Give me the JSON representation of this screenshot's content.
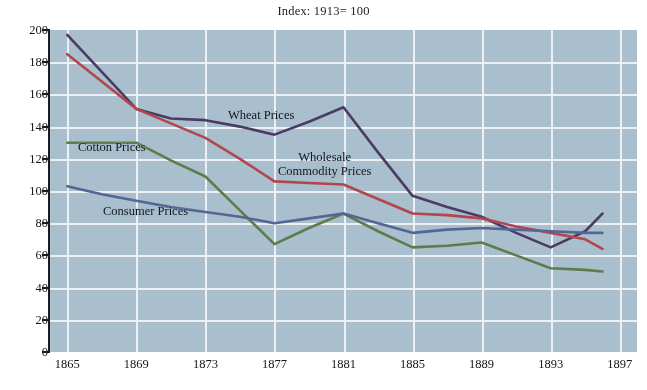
{
  "chart_data": {
    "type": "line",
    "title": "Index: 1913= 100",
    "xlabel": "",
    "ylabel": "",
    "xlim": [
      1864,
      1898
    ],
    "ylim": [
      0,
      200
    ],
    "ytick_step": 20,
    "grid": true,
    "legend_position": "inline-annotations",
    "background_color": "#a8bfcd",
    "gridline_color": "#edf2f6",
    "axis_color": "#1b1b24",
    "x_ticks": [
      "1865",
      "1869",
      "1873",
      "1877",
      "1881",
      "1885",
      "1889",
      "1893",
      "1897"
    ],
    "y_ticks": [
      "0",
      "20",
      "40",
      "60",
      "80",
      "100",
      "120",
      "140",
      "160",
      "180",
      "200"
    ],
    "x": [
      1865,
      1867,
      1869,
      1871,
      1873,
      1875,
      1877,
      1879,
      1881,
      1883,
      1885,
      1887,
      1889,
      1891,
      1893,
      1895,
      1896
    ],
    "series": [
      {
        "name": "Wheat Prices",
        "color": "#4a3a63",
        "values": [
          197,
          174,
          151,
          145,
          144,
          140,
          135,
          143,
          152,
          124,
          97,
          90,
          84,
          74,
          65,
          75,
          86
        ]
      },
      {
        "name": "Wholesale Commodity Prices",
        "color": "#b3444b",
        "values": [
          185,
          168,
          151,
          142,
          133,
          120,
          106,
          105,
          104,
          95,
          86,
          85,
          83,
          78,
          74,
          70,
          64
        ]
      },
      {
        "name": "Cotton Prices",
        "color": "#5c7a4a",
        "values": [
          130,
          130,
          130,
          119,
          109,
          88,
          67,
          77,
          86,
          75,
          65,
          66,
          68,
          60,
          52,
          51,
          50
        ]
      },
      {
        "name": "Consumer Prices",
        "color": "#546493",
        "values": [
          103,
          98,
          94,
          90,
          87,
          84,
          80,
          83,
          86,
          80,
          74,
          76,
          77,
          76,
          75,
          74,
          74
        ]
      }
    ],
    "annotations": [
      {
        "text": "Wheat Prices",
        "x_px": 228,
        "y_px": 108
      },
      {
        "text_line1": "Wholesale",
        "text_line2": "Commodity Prices",
        "x_px": 278,
        "y_px": 150
      },
      {
        "text": "Cotton Prices",
        "x_px": 78,
        "y_px": 140
      },
      {
        "text": "Consumer Prices",
        "x_px": 103,
        "y_px": 204
      }
    ]
  },
  "labels": {
    "title": "Index: 1913= 100",
    "wheat": "Wheat Prices",
    "cotton": "Cotton Prices",
    "consumer": "Consumer Prices",
    "wholesale_line1": "Wholesale",
    "wholesale_line2": "Commodity Prices"
  }
}
